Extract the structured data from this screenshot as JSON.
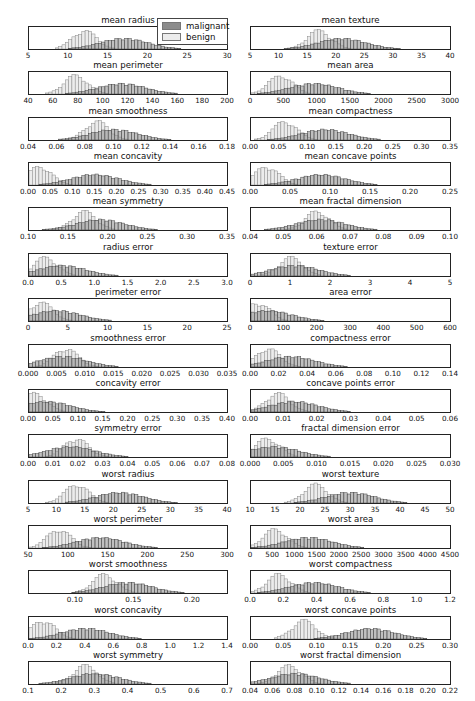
{
  "legend": {
    "items": [
      {
        "label": "malignant",
        "color": "#8c8c8c"
      },
      {
        "label": "benign",
        "color": "#ececec"
      }
    ]
  },
  "chart_data": {
    "type": "histogram-grid",
    "rows": 15,
    "cols": 2,
    "series": [
      "malignant",
      "benign"
    ],
    "legend_position": "top-left panel, upper right",
    "grid": false,
    "panels": [
      {
        "title": "mean radius",
        "xlim": [
          5,
          30
        ],
        "ticks": [
          "5",
          "10",
          "15",
          "20",
          "25",
          "30"
        ],
        "benign_peak": 12,
        "malignant_peak": 17
      },
      {
        "title": "mean texture",
        "xlim": [
          5,
          40
        ],
        "ticks": [
          "5",
          "10",
          "15",
          "20",
          "25",
          "30",
          "35",
          "40"
        ],
        "benign_peak": 17,
        "malignant_peak": 21
      },
      {
        "title": "mean perimeter",
        "xlim": [
          40,
          200
        ],
        "ticks": [
          "40",
          "60",
          "80",
          "100",
          "120",
          "140",
          "160",
          "180",
          "200"
        ],
        "benign_peak": 78,
        "malignant_peak": 115
      },
      {
        "title": "mean area",
        "xlim": [
          0,
          3000
        ],
        "ticks": [
          "0",
          "500",
          "1000",
          "1500",
          "2000",
          "2500",
          "3000"
        ],
        "benign_peak": 450,
        "malignant_peak": 950
      },
      {
        "title": "mean smoothness",
        "xlim": [
          0.04,
          0.18
        ],
        "ticks": [
          "0.04",
          "0.06",
          "0.08",
          "0.10",
          "0.12",
          "0.14",
          "0.16",
          "0.18"
        ],
        "benign_peak": 0.088,
        "malignant_peak": 0.1
      },
      {
        "title": "mean compactness",
        "xlim": [
          0.0,
          0.35
        ],
        "ticks": [
          "0.00",
          "0.05",
          "0.10",
          "0.15",
          "0.20",
          "0.25",
          "0.30",
          "0.35"
        ],
        "benign_peak": 0.06,
        "malignant_peak": 0.13
      },
      {
        "title": "mean concavity",
        "xlim": [
          0.0,
          0.45
        ],
        "ticks": [
          "0.00",
          "0.05",
          "0.10",
          "0.15",
          "0.20",
          "0.25",
          "0.30",
          "0.35",
          "0.40",
          "0.45"
        ],
        "benign_peak": 0.025,
        "malignant_peak": 0.15
      },
      {
        "title": "mean concave points",
        "xlim": [
          0.0,
          0.25
        ],
        "ticks": [
          "0.00",
          "0.05",
          "0.10",
          "0.15",
          "0.20",
          "0.25"
        ],
        "benign_peak": 0.02,
        "malignant_peak": 0.088
      },
      {
        "title": "mean symmetry",
        "xlim": [
          0.1,
          0.35
        ],
        "ticks": [
          "0.10",
          "0.15",
          "0.20",
          "0.25",
          "0.30",
          "0.35"
        ],
        "benign_peak": 0.17,
        "malignant_peak": 0.19
      },
      {
        "title": "mean fractal dimension",
        "xlim": [
          0.04,
          0.1
        ],
        "ticks": [
          "0.04",
          "0.05",
          "0.06",
          "0.07",
          "0.08",
          "0.09",
          "0.10"
        ],
        "benign_peak": 0.06,
        "malignant_peak": 0.061
      },
      {
        "title": "radius error",
        "xlim": [
          0.0,
          3.0
        ],
        "ticks": [
          "0.0",
          "0.5",
          "1.0",
          "1.5",
          "2.0",
          "2.5",
          "3.0"
        ],
        "benign_peak": 0.25,
        "malignant_peak": 0.5
      },
      {
        "title": "texture error",
        "xlim": [
          0,
          5
        ],
        "ticks": [
          "0",
          "1",
          "2",
          "3",
          "4",
          "5"
        ],
        "benign_peak": 1.0,
        "malignant_peak": 1.1
      },
      {
        "title": "perimeter error",
        "xlim": [
          0,
          25
        ],
        "ticks": [
          "0",
          "5",
          "10",
          "15",
          "20",
          "25"
        ],
        "benign_peak": 1.5,
        "malignant_peak": 3.5
      },
      {
        "title": "area error",
        "xlim": [
          0,
          600
        ],
        "ticks": [
          "0",
          "100",
          "200",
          "300",
          "400",
          "500",
          "600"
        ],
        "benign_peak": 20,
        "malignant_peak": 50
      },
      {
        "title": "smoothness error",
        "xlim": [
          0.0,
          0.035
        ],
        "ticks": [
          "0.000",
          "0.005",
          "0.010",
          "0.015",
          "0.020",
          "0.025",
          "0.030",
          "0.035"
        ],
        "benign_peak": 0.0065,
        "malignant_peak": 0.006
      },
      {
        "title": "compactness error",
        "xlim": [
          0.0,
          0.14
        ],
        "ticks": [
          "0.00",
          "0.02",
          "0.04",
          "0.06",
          "0.08",
          "0.10",
          "0.12",
          "0.14"
        ],
        "benign_peak": 0.012,
        "malignant_peak": 0.028
      },
      {
        "title": "concavity error",
        "xlim": [
          0.0,
          0.4
        ],
        "ticks": [
          "0.00",
          "0.05",
          "0.10",
          "0.15",
          "0.20",
          "0.25",
          "0.30",
          "0.35",
          "0.40"
        ],
        "benign_peak": 0.012,
        "malignant_peak": 0.035
      },
      {
        "title": "concave points error",
        "xlim": [
          0.0,
          0.06
        ],
        "ticks": [
          "0.00",
          "0.01",
          "0.02",
          "0.03",
          "0.04",
          "0.05",
          "0.06"
        ],
        "benign_peak": 0.008,
        "malignant_peak": 0.013
      },
      {
        "title": "symmetry error",
        "xlim": [
          0.0,
          0.08
        ],
        "ticks": [
          "0.00",
          "0.01",
          "0.02",
          "0.03",
          "0.04",
          "0.05",
          "0.06",
          "0.07",
          "0.08"
        ],
        "benign_peak": 0.019,
        "malignant_peak": 0.017
      },
      {
        "title": "fractal dimension error",
        "xlim": [
          0.0,
          0.03
        ],
        "ticks": [
          "0.000",
          "0.005",
          "0.010",
          "0.015",
          "0.020",
          "0.025",
          "0.030"
        ],
        "benign_peak": 0.0025,
        "malignant_peak": 0.0035
      },
      {
        "title": "worst radius",
        "xlim": [
          5,
          40
        ],
        "ticks": [
          "5",
          "10",
          "15",
          "20",
          "25",
          "30",
          "35",
          "40"
        ],
        "benign_peak": 13.5,
        "malignant_peak": 21
      },
      {
        "title": "worst texture",
        "xlim": [
          10,
          50
        ],
        "ticks": [
          "10",
          "15",
          "20",
          "25",
          "30",
          "35",
          "40",
          "45",
          "50"
        ],
        "benign_peak": 23,
        "malignant_peak": 30
      },
      {
        "title": "worst perimeter",
        "xlim": [
          50,
          300
        ],
        "ticks": [
          "50",
          "100",
          "150",
          "200",
          "250",
          "300"
        ],
        "benign_peak": 88,
        "malignant_peak": 140
      },
      {
        "title": "worst area",
        "xlim": [
          0,
          4500
        ],
        "ticks": [
          "0",
          "500",
          "1000",
          "1500",
          "2000",
          "2500",
          "3000",
          "3500",
          "4000",
          "4500"
        ],
        "benign_peak": 550,
        "malignant_peak": 1300
      },
      {
        "title": "worst smoothness",
        "xlim": [
          0.06,
          0.23
        ],
        "ticks": [
          "0.10",
          "0.15",
          "0.20"
        ],
        "benign_peak": 0.125,
        "malignant_peak": 0.145
      },
      {
        "title": "worst compactness",
        "xlim": [
          0.0,
          1.2
        ],
        "ticks": [
          "0.0",
          "0.2",
          "0.4",
          "0.6",
          "0.8",
          "1.0",
          "1.2"
        ],
        "benign_peak": 0.17,
        "malignant_peak": 0.38
      },
      {
        "title": "worst concavity",
        "xlim": [
          0.0,
          1.4
        ],
        "ticks": [
          "0.0",
          "0.2",
          "0.4",
          "0.6",
          "0.8",
          "1.0",
          "1.2",
          "1.4"
        ],
        "benign_peak": 0.1,
        "malignant_peak": 0.4
      },
      {
        "title": "worst concave points",
        "xlim": [
          0.0,
          0.3
        ],
        "ticks": [
          "0.00",
          "0.05",
          "0.10",
          "0.15",
          "0.20",
          "0.25",
          "0.30"
        ],
        "benign_peak": 0.08,
        "malignant_peak": 0.18
      },
      {
        "title": "worst symmetry",
        "xlim": [
          0.1,
          0.7
        ],
        "ticks": [
          "0.1",
          "0.2",
          "0.3",
          "0.4",
          "0.5",
          "0.6",
          "0.7"
        ],
        "benign_peak": 0.27,
        "malignant_peak": 0.3
      },
      {
        "title": "worst fractal dimension",
        "xlim": [
          0.04,
          0.22
        ],
        "ticks": [
          "0.04",
          "0.06",
          "0.08",
          "0.10",
          "0.12",
          "0.14",
          "0.16",
          "0.18",
          "0.20",
          "0.22"
        ],
        "benign_peak": 0.075,
        "malignant_peak": 0.08
      }
    ]
  }
}
